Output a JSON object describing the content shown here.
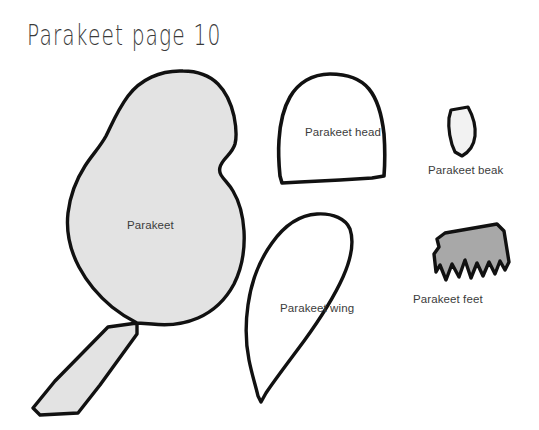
{
  "page": {
    "title": "Parakeet page 10",
    "background_color": "#ffffff",
    "width": 539,
    "height": 430
  },
  "colors": {
    "outline": "#111111",
    "body_fill": "#e3e3e3",
    "head_fill": "#ffffff",
    "beak_fill": "#f2f2f2",
    "wing_fill": "#ffffff",
    "feet_fill": "#a8a8a8",
    "label_text": "#3c3c3c",
    "title_text": "#3a3a3a"
  },
  "pieces": [
    {
      "id": "body",
      "label": "Parakeet",
      "fill": "#e3e3e3",
      "outline": "#111111"
    },
    {
      "id": "head",
      "label": "Parakeet head",
      "fill": "#ffffff",
      "outline": "#111111"
    },
    {
      "id": "beak",
      "label": "Parakeet beak",
      "fill": "#f2f2f2",
      "outline": "#111111"
    },
    {
      "id": "wing",
      "label": "Parakeet wing",
      "fill": "#ffffff",
      "outline": "#111111"
    },
    {
      "id": "feet",
      "label": "Parakeet feet",
      "fill": "#a8a8a8",
      "outline": "#111111"
    }
  ],
  "labels": {
    "body": "Parakeet",
    "head": "Parakeet head",
    "beak": "Parakeet beak",
    "wing": "Parakeet wing",
    "feet": "Parakeet feet"
  }
}
